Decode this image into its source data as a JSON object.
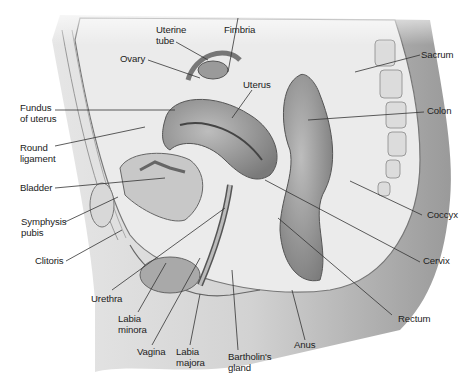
{
  "figure": {
    "labels": {
      "uterine_tube": "Uterine\ntube",
      "fimbria": "Fimbria",
      "ovary": "Ovary",
      "uterus": "Uterus",
      "sacrum": "Sacrum",
      "colon": "Colon",
      "fundus": "Fundus\nof uterus",
      "round_ligament": "Round\nligament",
      "bladder": "Bladder",
      "symphysis_pubis": "Symphysis\npubis",
      "clitoris": "Clitoris",
      "coccyx": "Coccyx",
      "cervix": "Cervix",
      "urethra": "Urethra",
      "labia_minora": "Labia\nminora",
      "vagina": "Vagina",
      "labia_majora": "Labia\nmajora",
      "bartholins_gland": "Bartholin's\ngland",
      "anus": "Anus",
      "rectum": "Rectum"
    }
  }
}
